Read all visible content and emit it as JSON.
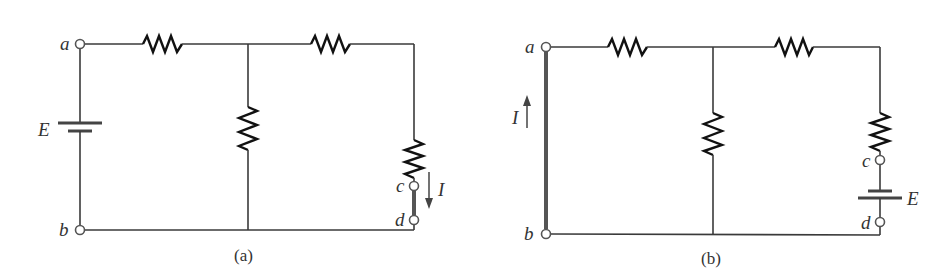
{
  "figure": {
    "type": "circuit-diagram",
    "panels": [
      {
        "id": "a",
        "caption": "(a)",
        "terminals": {
          "a": "a",
          "b": "b",
          "c": "c",
          "d": "d"
        },
        "source_label": "E",
        "current_label": "I",
        "current_direction": "down (c to d)",
        "description": "Voltage source E between a and b; ladder of 4 resistors; short circuit between c and d carrying current I"
      },
      {
        "id": "b",
        "caption": "(b)",
        "terminals": {
          "a": "a",
          "b": "b",
          "c": "c",
          "d": "d"
        },
        "source_label": "E",
        "current_label": "I",
        "current_direction": "up (b to a)",
        "description": "Source E moved between c and d; short circuit between a and b carrying current I (reciprocity theorem)"
      }
    ],
    "colors": {
      "wire": "#3a3a3a",
      "resistor": "#111111",
      "short": "#555555",
      "background": "#ffffff"
    }
  }
}
